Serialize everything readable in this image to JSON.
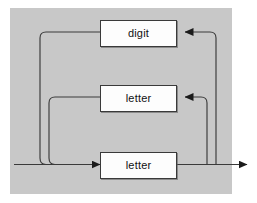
{
  "figure": {
    "type": "syntax-railroad-diagram",
    "panel_color": "#c8c8c8",
    "line_color": "#333333",
    "node_fill": "#fdfdfd"
  },
  "nodes": [
    {
      "id": "digit",
      "label": "digit",
      "x": 100,
      "y": 20,
      "w": 75,
      "h": 25
    },
    {
      "id": "letter_mid",
      "label": "letter",
      "x": 100,
      "y": 85,
      "w": 75,
      "h": 25
    },
    {
      "id": "letter_bottom",
      "label": "letter",
      "x": 100,
      "y": 152,
      "w": 75,
      "h": 25
    }
  ],
  "arrows": {
    "entry_label": "entry-arrow-into-letter-bottom",
    "exit_label": "exit-arrow",
    "into_digit_label": "arrow-into-digit",
    "into_letter_mid_label": "arrow-into-letter-mid"
  },
  "paths": {
    "entry": "left edge to bottom letter box",
    "exit": "bottom letter box to right edge",
    "loop_outer": "after bottom box, right rail up to digit box, then left rail down to main line",
    "loop_inner": "after bottom box, right rail up to middle letter box, then left rail down to main line"
  }
}
